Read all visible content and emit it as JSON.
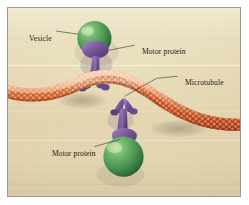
{
  "figure": {
    "background_color": "#e4d7b2",
    "frame_color": "#9a9a97"
  },
  "labels": [
    {
      "id": "vesicle",
      "text": "Vesicle",
      "target": "upper-green-vesicle"
    },
    {
      "id": "motor_protein_top",
      "text": "Motor protein",
      "target": "upper-purple-motor-protein"
    },
    {
      "id": "microtubule",
      "text": "Microtubule",
      "target": "microtubule-filament"
    },
    {
      "id": "motor_protein_bottom",
      "text": "Motor protein",
      "target": "lower-purple-motor-protein"
    }
  ],
  "structures": {
    "microtubule": {
      "name": "Microtubule",
      "color_dark": "#c04a22",
      "color_mid": "#dd6b33",
      "color_light": "#f0cfae",
      "description": "Curved S-shaped filament of tubulin dimers crossing the panel"
    },
    "vesicle_upper": {
      "name": "Vesicle",
      "color": "#4f9a55",
      "highlight": "#9ed19a"
    },
    "vesicle_lower": {
      "name": "Vesicle",
      "color": "#4f9a55",
      "highlight": "#9ed19a"
    },
    "motor_protein_upper": {
      "name": "Motor protein",
      "color": "#7d5ba0",
      "shadow": "#4f3569"
    },
    "motor_protein_lower": {
      "name": "Motor protein",
      "color": "#7d5ba0",
      "shadow": "#4f3569"
    }
  }
}
